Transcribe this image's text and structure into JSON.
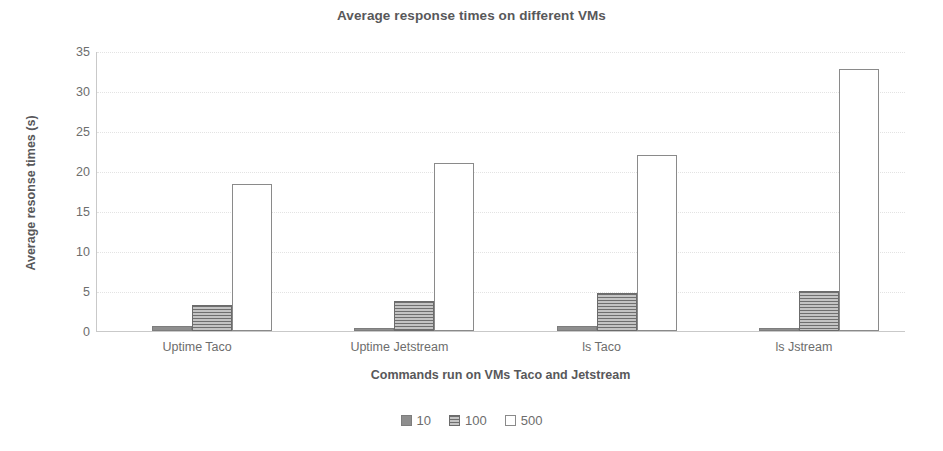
{
  "chart_data": {
    "type": "bar",
    "title": "Average response times on different VMs",
    "xlabel": "Commands run on VMs  Taco and Jetstream",
    "ylabel": "Average resonse times (s)",
    "categories": [
      "Uptime Taco",
      "Uptime Jetstream",
      "ls Taco",
      "ls Jstream"
    ],
    "series": [
      {
        "name": "10",
        "values": [
          0.6,
          0.4,
          0.6,
          0.4
        ]
      },
      {
        "name": "100",
        "values": [
          3.2,
          3.7,
          4.7,
          5.0
        ]
      },
      {
        "name": "500",
        "values": [
          18.4,
          21.0,
          22.0,
          32.8
        ]
      }
    ],
    "ylim": [
      0,
      35
    ],
    "yticks": [
      "0",
      "5",
      "10",
      "15",
      "20",
      "25",
      "30",
      "35"
    ],
    "ytick_values": [
      0,
      5,
      10,
      15,
      20,
      25,
      30,
      35
    ],
    "grid": true,
    "grid_axis": "y",
    "legend_position": "bottom",
    "colors": {
      "series_10": "#8e8e8e",
      "series_100": "#9a9a9a",
      "series_500": "#ffffff",
      "bar_outline": "#8a8a8a",
      "text": "#6d6d6d",
      "title": "#58585a",
      "gridline": "#e3e3e3",
      "axis": "#c9c9c9",
      "background": "#ffffff"
    }
  },
  "legend": {
    "items": [
      {
        "label": "10"
      },
      {
        "label": "100"
      },
      {
        "label": "500"
      }
    ]
  }
}
